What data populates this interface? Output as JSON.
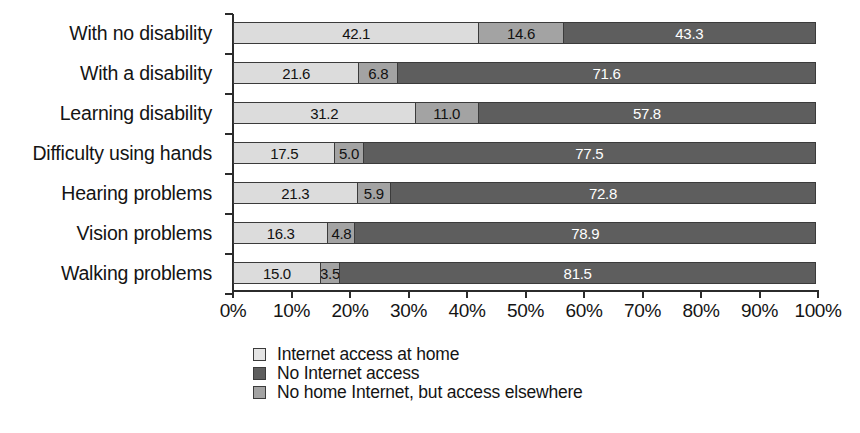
{
  "chart_data": {
    "type": "bar",
    "orientation": "horizontal",
    "stacked": true,
    "stack_total": 100,
    "title": "",
    "subtitle": "",
    "xlabel": "",
    "ylabel": "",
    "xlim": [
      0,
      100
    ],
    "grid": false,
    "legend_position": "bottom",
    "categories": [
      "With no disability",
      "With a disability",
      "Learning disability",
      "Difficulty using hands",
      "Hearing problems",
      "Vision problems",
      "Walking problems"
    ],
    "xticks": [
      0,
      10,
      20,
      30,
      40,
      50,
      60,
      70,
      80,
      90,
      100
    ],
    "xticklabels": [
      "0%",
      "10%",
      "20%",
      "30%",
      "40%",
      "50%",
      "60%",
      "70%",
      "80%",
      "90%",
      "100%"
    ],
    "series": [
      {
        "name": "Internet access at home",
        "color": "#dcdcdc",
        "values": [
          42.1,
          21.6,
          31.2,
          17.5,
          21.3,
          16.3,
          15.0
        ],
        "labels": [
          "42.1",
          "21.6",
          "31.2",
          "17.5",
          "21.3",
          "16.3",
          "15.0"
        ]
      },
      {
        "name": "No home Internet, but access elsewhere",
        "color": "#a3a3a3",
        "values": [
          14.6,
          6.8,
          11.0,
          5.0,
          5.9,
          4.8,
          3.5
        ],
        "labels": [
          "14.6",
          "6.8",
          "11.0",
          "5.0",
          "5.9",
          "4.8",
          "3.5"
        ]
      },
      {
        "name": "No Internet access",
        "color": "#5e5e5e",
        "values": [
          43.3,
          71.6,
          57.8,
          77.5,
          72.8,
          78.9,
          81.5
        ],
        "labels": [
          "43.3",
          "71.6",
          "57.8",
          "77.5",
          "72.8",
          "78.9",
          "81.5"
        ]
      }
    ]
  },
  "legend": {
    "items": [
      {
        "label": "Internet access at home",
        "swatch": "light"
      },
      {
        "label": "No Internet access",
        "swatch": "dark"
      },
      {
        "label": "No home Internet, but access elsewhere",
        "swatch": "medium"
      }
    ]
  }
}
